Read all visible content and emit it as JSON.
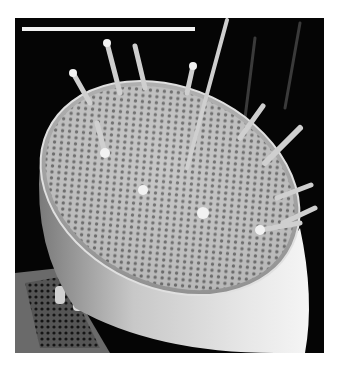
{
  "figure": {
    "colors": {
      "background": "#050505",
      "scale_bar": "#f2f2f2",
      "valve_face": "#b9b9b9",
      "mantle": "#d8d8d8"
    },
    "scale_bar": {
      "x1": 7,
      "x2": 180,
      "y": 11,
      "label": ""
    }
  },
  "caption": {
    "text": ""
  }
}
